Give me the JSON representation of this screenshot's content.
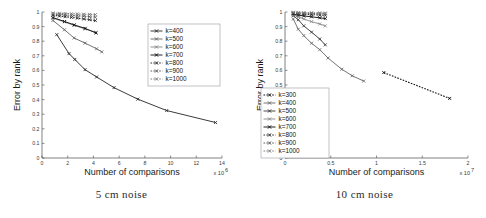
{
  "figure": {
    "panels": [
      {
        "id": "left",
        "caption": "5 cm noise",
        "axis": {
          "ylabel": "Error by rank",
          "xlabel": "Number of comparisons",
          "x_exponent": "x 10",
          "x_exponent_sup": "6",
          "xticks": [
            "0",
            "2",
            "4",
            "6",
            "8",
            "10",
            "12",
            "14"
          ],
          "yticks": [
            "0",
            "0.1",
            "0.2",
            "0.3",
            "0.4",
            "0.5",
            "0.6",
            "0.7",
            "0.8",
            "0.9",
            "1"
          ]
        },
        "legend": {
          "position": "top-right",
          "entries": [
            "k=400",
            "k=500",
            "k=600",
            "k=700",
            "k=800",
            "k=900",
            "k=1000"
          ]
        }
      },
      {
        "id": "right",
        "caption": "10 cm noise",
        "axis": {
          "ylabel": "Error by rank",
          "xlabel": "Number of comparisons",
          "x_exponent": "x 10",
          "x_exponent_sup": "7",
          "xticks": [
            "0",
            "0.5",
            "1",
            "1.5",
            "2"
          ],
          "yticks": [
            "0",
            "0.1",
            "0.2",
            "0.3",
            "0.4",
            "0.5",
            "0.6",
            "0.7",
            "0.8",
            "0.9",
            "1"
          ]
        },
        "legend": {
          "position": "bottom-left",
          "entries": [
            "k=300",
            "k=400",
            "k=500",
            "k=600",
            "k=700",
            "k=800",
            "k=900",
            "k=1000"
          ]
        }
      }
    ]
  },
  "chart_data": [
    {
      "type": "line",
      "title": "5 cm noise",
      "xlabel": "Number of comparisons",
      "ylabel": "Error by rank",
      "xlim": [
        0,
        14
      ],
      "ylim": [
        0,
        1
      ],
      "x_scale_factor": "1e6",
      "grid": false,
      "legend_position": "upper right",
      "marker": "x",
      "series": [
        {
          "name": "k=400",
          "linestyle": "solid",
          "color": "#303030",
          "x": [
            1.15,
            2.1,
            2.55,
            3.35,
            4.25,
            5.6,
            7.45,
            9.7,
            13.5
          ],
          "y": [
            0.845,
            0.715,
            0.675,
            0.605,
            0.555,
            0.482,
            0.403,
            0.325,
            0.243
          ]
        },
        {
          "name": "k=500",
          "linestyle": "solid",
          "color": "#6b6b6b",
          "x": [
            0.85,
            1.75,
            2.5,
            3.35,
            4.25,
            4.65
          ],
          "y": [
            0.942,
            0.878,
            0.822,
            0.787,
            0.748,
            0.727
          ]
        },
        {
          "name": "k=600",
          "linestyle": "solid",
          "color": "#8a8a8a",
          "x": [
            0.85,
            1.75,
            2.5,
            3.35,
            4.2
          ],
          "y": [
            0.958,
            0.932,
            0.908,
            0.884,
            0.862
          ]
        },
        {
          "name": "k=700",
          "linestyle": "solid",
          "color": "#151515",
          "x": [
            0.85,
            1.75,
            2.5,
            3.35,
            4.2
          ],
          "y": [
            0.962,
            0.935,
            0.912,
            0.888,
            0.856
          ]
        },
        {
          "name": "k=800",
          "linestyle": "dashed",
          "color": "#2a2a2a",
          "x": [
            0.85,
            1.35,
            1.8,
            2.3,
            2.75,
            3.25,
            3.7,
            4.15
          ],
          "y": [
            0.978,
            0.972,
            0.968,
            0.963,
            0.958,
            0.952,
            0.947,
            0.941
          ]
        },
        {
          "name": "k=900",
          "linestyle": "dashed",
          "color": "#5a5a5a",
          "x": [
            0.85,
            1.35,
            1.8,
            2.3,
            2.75,
            3.25,
            3.7,
            4.15
          ],
          "y": [
            0.986,
            0.983,
            0.98,
            0.977,
            0.974,
            0.971,
            0.968,
            0.964
          ]
        },
        {
          "name": "k=1000",
          "linestyle": "dashed",
          "color": "#7d7d7d",
          "x": [
            0.85,
            1.35,
            1.8,
            2.3,
            2.75,
            3.25,
            3.7,
            4.15
          ],
          "y": [
            0.993,
            0.991,
            0.99,
            0.988,
            0.987,
            0.985,
            0.984,
            0.982
          ]
        }
      ]
    },
    {
      "type": "line",
      "title": "10 cm noise",
      "xlabel": "Number of comparisons",
      "ylabel": "Error by rank",
      "xlim": [
        0,
        2
      ],
      "ylim": [
        0,
        1
      ],
      "x_scale_factor": "1e7",
      "grid": false,
      "legend_position": "lower left",
      "marker": "x",
      "series": [
        {
          "name": "k=300",
          "linestyle": "dashed",
          "color": "#111111",
          "x": [
            1.08,
            1.8
          ],
          "y": [
            0.585,
            0.408
          ]
        },
        {
          "name": "k=400",
          "linestyle": "solid",
          "color": "#6e6e6e",
          "x": [
            0.09,
            0.145,
            0.205,
            0.29,
            0.38,
            0.47,
            0.62,
            0.735,
            0.86
          ],
          "y": [
            0.952,
            0.882,
            0.838,
            0.786,
            0.742,
            0.685,
            0.608,
            0.563,
            0.527
          ]
        },
        {
          "name": "k=500",
          "linestyle": "solid",
          "color": "#3f3f3f",
          "x": [
            0.09,
            0.145,
            0.205,
            0.29,
            0.38,
            0.44
          ],
          "y": [
            0.975,
            0.947,
            0.905,
            0.862,
            0.815,
            0.775
          ]
        },
        {
          "name": "k=600",
          "linestyle": "solid",
          "color": "#8d8d8d",
          "x": [
            0.09,
            0.145,
            0.205,
            0.29,
            0.38,
            0.44
          ],
          "y": [
            0.982,
            0.967,
            0.952,
            0.934,
            0.918,
            0.905
          ]
        },
        {
          "name": "k=700",
          "linestyle": "solid",
          "color": "#141414",
          "x": [
            0.09,
            0.145,
            0.205,
            0.29,
            0.38,
            0.44
          ],
          "y": [
            0.987,
            0.979,
            0.973,
            0.967,
            0.96,
            0.955
          ]
        },
        {
          "name": "k=800",
          "linestyle": "dashed",
          "color": "#2d2d2d",
          "x": [
            0.09,
            0.145,
            0.205,
            0.29,
            0.38,
            0.44
          ],
          "y": [
            0.991,
            0.988,
            0.985,
            0.982,
            0.979,
            0.977
          ]
        },
        {
          "name": "k=900",
          "linestyle": "dashed",
          "color": "#595959",
          "x": [
            0.09,
            0.145,
            0.205,
            0.29,
            0.38,
            0.44
          ],
          "y": [
            0.995,
            0.993,
            0.992,
            0.99,
            0.988,
            0.987
          ]
        },
        {
          "name": "k=1000",
          "linestyle": "dashed",
          "color": "#7f7f7f",
          "x": [
            0.09,
            0.145,
            0.205,
            0.29,
            0.38,
            0.44
          ],
          "y": [
            0.998,
            0.997,
            0.996,
            0.995,
            0.994,
            0.993
          ]
        }
      ]
    }
  ]
}
